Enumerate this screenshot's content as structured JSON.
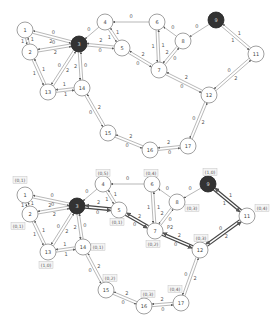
{
  "graphs": [
    {
      "id": "top",
      "nodes": [
        {
          "id": "1",
          "x": 25,
          "y": 30,
          "dark": false
        },
        {
          "id": "2",
          "x": 30,
          "y": 52,
          "dark": false
        },
        {
          "id": "3",
          "x": 79,
          "y": 44,
          "dark": true
        },
        {
          "id": "4",
          "x": 105,
          "y": 22,
          "dark": false
        },
        {
          "id": "5",
          "x": 122,
          "y": 48,
          "dark": false
        },
        {
          "id": "6",
          "x": 157,
          "y": 22,
          "dark": false
        },
        {
          "id": "7",
          "x": 159,
          "y": 70,
          "dark": false
        },
        {
          "id": "8",
          "x": 183,
          "y": 41,
          "dark": false
        },
        {
          "id": "9",
          "x": 216,
          "y": 20,
          "dark": true
        },
        {
          "id": "11",
          "x": 256,
          "y": 54,
          "dark": false
        },
        {
          "id": "12",
          "x": 209,
          "y": 95,
          "dark": false
        },
        {
          "id": "13",
          "x": 48,
          "y": 92,
          "dark": false
        },
        {
          "id": "14",
          "x": 82,
          "y": 88,
          "dark": false
        },
        {
          "id": "15",
          "x": 108,
          "y": 133,
          "dark": false
        },
        {
          "id": "16",
          "x": 150,
          "y": 150,
          "dark": false
        },
        {
          "id": "17",
          "x": 188,
          "y": 146,
          "dark": false
        }
      ],
      "edges": [
        {
          "a": "1",
          "b": "3",
          "wab": "2",
          "wba": "0"
        },
        {
          "a": "2",
          "b": "3",
          "wab": "2",
          "wba": "0"
        },
        {
          "a": "1",
          "b": "2",
          "wab": "1",
          "wba": "1"
        },
        {
          "a": "2",
          "b": "13",
          "wab": "1",
          "wba": "1"
        },
        {
          "a": "13",
          "b": "3",
          "wab": "2",
          "wba": "0"
        },
        {
          "a": "3",
          "b": "14",
          "wab": "2",
          "wba": "0"
        },
        {
          "a": "13",
          "b": "14",
          "wab": "1",
          "wba": "1"
        },
        {
          "a": "4",
          "b": "3",
          "wab": "0",
          "wba": ""
        },
        {
          "a": "3",
          "b": "5",
          "wab": "0",
          "wba": "2"
        },
        {
          "a": "4",
          "b": "5",
          "wab": "1",
          "wba": "1"
        },
        {
          "a": "6",
          "b": "4",
          "wab": "0",
          "wba": ""
        },
        {
          "a": "5",
          "b": "7",
          "wab": "0",
          "wba": "2"
        },
        {
          "a": "6",
          "b": "7",
          "wab": "1",
          "wba": "1"
        },
        {
          "a": "8",
          "b": "6",
          "wab": "0",
          "wba": ""
        },
        {
          "a": "7",
          "b": "8",
          "wab": "0",
          "wba": "2"
        },
        {
          "a": "9",
          "b": "8",
          "wab": "0",
          "wba": ""
        },
        {
          "a": "9",
          "b": "11",
          "wab": "1",
          "wba": "1"
        },
        {
          "a": "7",
          "b": "12",
          "wab": "0",
          "wba": "2"
        },
        {
          "a": "11",
          "b": "12",
          "wab": "0",
          "wba": "2"
        },
        {
          "a": "14",
          "b": "15",
          "wab": "0",
          "wba": "2"
        },
        {
          "a": "15",
          "b": "16",
          "wab": "0",
          "wba": "2"
        },
        {
          "a": "16",
          "b": "17",
          "wab": "0",
          "wba": "2"
        },
        {
          "a": "12",
          "b": "17",
          "wab": "0",
          "wba": "2"
        }
      ]
    },
    {
      "id": "bottom",
      "nodes": [
        {
          "id": "1",
          "x": 25,
          "y": 195,
          "dark": false,
          "tag": "(0,1)",
          "tx": 20,
          "ty": 180
        },
        {
          "id": "2",
          "x": 30,
          "y": 214,
          "dark": false,
          "tag": "(0,1)",
          "tx": 18,
          "ty": 226
        },
        {
          "id": "3",
          "x": 77,
          "y": 206,
          "dark": true
        },
        {
          "id": "4",
          "x": 103,
          "y": 184,
          "dark": false,
          "tag": "(0,5)",
          "tx": 103,
          "ty": 173
        },
        {
          "id": "5",
          "x": 119,
          "y": 210,
          "dark": false,
          "tag": "(0,1)",
          "tx": 117,
          "ty": 222
        },
        {
          "id": "6",
          "x": 152,
          "y": 184,
          "dark": false,
          "tag": "(0,4)",
          "tx": 151,
          "ty": 173
        },
        {
          "id": "7",
          "x": 155,
          "y": 231,
          "dark": false,
          "tag": "(0,2)",
          "tx": 153,
          "ty": 244
        },
        {
          "id": "8",
          "x": 177,
          "y": 202,
          "dark": false,
          "tag": "(0,3)",
          "tx": 192,
          "ty": 208
        },
        {
          "id": "9",
          "x": 208,
          "y": 184,
          "dark": true,
          "tag": "(1,0)",
          "tx": 210,
          "ty": 172
        },
        {
          "id": "11",
          "x": 247,
          "y": 216,
          "dark": false,
          "tag": "(0,4)",
          "tx": 262,
          "ty": 208
        },
        {
          "id": "12",
          "x": 200,
          "y": 250,
          "dark": false,
          "tag": "(0,3)",
          "tx": 201,
          "ty": 238
        },
        {
          "id": "13",
          "x": 48,
          "y": 252,
          "dark": false,
          "tag": "(1,0)",
          "tx": 46,
          "ty": 265
        },
        {
          "id": "14",
          "x": 83,
          "y": 247,
          "dark": false,
          "tag": "(0,1)",
          "tx": 98,
          "ty": 247
        },
        {
          "id": "15",
          "x": 106,
          "y": 290,
          "dark": false,
          "tag": "(0,2)",
          "tx": 110,
          "ty": 278
        },
        {
          "id": "16",
          "x": 144,
          "y": 306,
          "dark": false,
          "tag": "(0,3)",
          "tx": 148,
          "ty": 294
        },
        {
          "id": "17",
          "x": 181,
          "y": 303,
          "dark": false,
          "tag": "(0,4)",
          "tx": 175,
          "ty": 289
        }
      ],
      "edges": [
        {
          "a": "1",
          "b": "3",
          "wab": "2",
          "wba": "0"
        },
        {
          "a": "2",
          "b": "3",
          "wab": "2",
          "wba": "0"
        },
        {
          "a": "1",
          "b": "2",
          "wab": "1",
          "wba": "1"
        },
        {
          "a": "2",
          "b": "13",
          "wab": "1",
          "wba": "1"
        },
        {
          "a": "13",
          "b": "3",
          "wab": "2",
          "wba": "0"
        },
        {
          "a": "3",
          "b": "14",
          "wab": "2",
          "wba": "0"
        },
        {
          "a": "13",
          "b": "14",
          "wab": "1",
          "wba": "1"
        },
        {
          "a": "4",
          "b": "3",
          "wab": "0",
          "wba": ""
        },
        {
          "a": "3",
          "b": "5",
          "wab": "0",
          "wba": "2",
          "bold": true
        },
        {
          "a": "4",
          "b": "5",
          "wab": "1",
          "wba": "1"
        },
        {
          "a": "6",
          "b": "4",
          "wab": "0",
          "wba": ""
        },
        {
          "a": "5",
          "b": "7",
          "wab": "0",
          "wba": "2",
          "bold": true
        },
        {
          "a": "6",
          "b": "7",
          "wab": "1",
          "wba": "1"
        },
        {
          "a": "8",
          "b": "6",
          "wab": "0",
          "wba": ""
        },
        {
          "a": "7",
          "b": "8",
          "wab": "0",
          "wba": "2"
        },
        {
          "a": "9",
          "b": "8",
          "wab": "0",
          "wba": ""
        },
        {
          "a": "9",
          "b": "11",
          "wab": "1",
          "wba": "1",
          "bold": true
        },
        {
          "a": "7",
          "b": "12",
          "wab": "0",
          "wba": "2",
          "bold": true
        },
        {
          "a": "11",
          "b": "12",
          "wab": "0",
          "wba": "2",
          "bold": true
        },
        {
          "a": "14",
          "b": "15",
          "wab": "0",
          "wba": "2"
        },
        {
          "a": "15",
          "b": "16",
          "wab": "0",
          "wba": "2"
        },
        {
          "a": "16",
          "b": "17",
          "wab": "0",
          "wba": "2"
        },
        {
          "a": "12",
          "b": "17",
          "wab": "0",
          "wba": "2"
        }
      ],
      "annotations": [
        {
          "text": "P2",
          "x": 170,
          "y": 228
        }
      ]
    }
  ]
}
